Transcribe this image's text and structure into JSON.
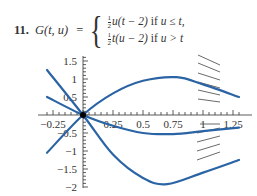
{
  "problem": {
    "number": "11.",
    "lhs": "G(t, u)",
    "equals": "=",
    "cases": [
      {
        "coef_num": "1",
        "coef_den": "2",
        "expr": "u(t − 2)",
        "cond_kw": "if",
        "cond": "u ≤ t,"
      },
      {
        "coef_num": "1",
        "coef_den": "2",
        "expr": "t(u − 2)",
        "cond_kw": "if",
        "cond": "u > t"
      }
    ]
  },
  "chart_data": {
    "type": "line",
    "xlabel": "",
    "ylabel": "",
    "xlim": [
      -0.3,
      1.3
    ],
    "ylim": [
      -2,
      1.6
    ],
    "x_ticks": [
      "-0.25",
      "0.25",
      "0.5",
      "0.75",
      "1",
      "1.25"
    ],
    "y_ticks": [
      "1.5",
      "1",
      "0.5",
      "-0.5",
      "-1",
      "-1.5",
      "-2"
    ],
    "grid": false,
    "legend": "none",
    "origin_marker": {
      "x": 0,
      "y": 0
    },
    "series": [
      {
        "name": "upper-curve",
        "points": [
          [
            -0.3,
            -1.05
          ],
          [
            0,
            0
          ],
          [
            0.25,
            0.6
          ],
          [
            0.5,
            0.95
          ],
          [
            0.78,
            1.05
          ],
          [
            1.0,
            0.85
          ],
          [
            1.3,
            0.5
          ]
        ]
      },
      {
        "name": "middle-curve",
        "points": [
          [
            -0.3,
            0.5
          ],
          [
            0,
            0
          ],
          [
            0.25,
            -0.3
          ],
          [
            0.5,
            -0.5
          ],
          [
            0.75,
            -0.53
          ],
          [
            1.0,
            -0.45
          ],
          [
            1.3,
            -0.35
          ]
        ]
      },
      {
        "name": "lower-curve",
        "points": [
          [
            -0.3,
            1.25
          ],
          [
            0,
            0
          ],
          [
            0.25,
            -1.1
          ],
          [
            0.5,
            -1.75
          ],
          [
            0.7,
            -1.92
          ],
          [
            1.0,
            -1.6
          ],
          [
            1.3,
            -1.25
          ]
        ]
      }
    ],
    "slope_field_segments_at_x": 1.0,
    "colors": {
      "curve": "#2a64a4",
      "axis": "#333333",
      "slope": "#444444"
    }
  }
}
